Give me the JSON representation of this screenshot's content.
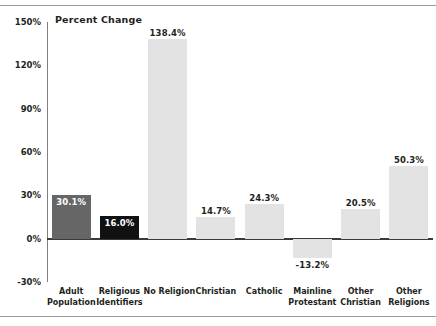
{
  "chart_data": {
    "type": "bar",
    "title": "Percent Change",
    "xlabel": "",
    "ylabel": "",
    "ylim": [
      -30,
      150
    ],
    "yticks": [
      "-30%",
      "0%",
      "30%",
      "60%",
      "90%",
      "120%",
      "150%"
    ],
    "ytick_values": [
      -30,
      0,
      30,
      60,
      90,
      120,
      150
    ],
    "grid": false,
    "legend": "none",
    "categories": [
      "Adult Population",
      "Religious Identifiers",
      "No Religion",
      "Christian",
      "Catholic",
      "Mainline Protestant",
      "Other Christian",
      "Other Religions"
    ],
    "category_lines": [
      [
        "Adult",
        "Population"
      ],
      [
        "Religious",
        "Identifiers"
      ],
      [
        "No Religion",
        ""
      ],
      [
        "Christian",
        ""
      ],
      [
        "Catholic",
        ""
      ],
      [
        "Mainline",
        "Protestant"
      ],
      [
        "Other",
        "Christian"
      ],
      [
        "Other",
        "Religions"
      ]
    ],
    "values": [
      30.1,
      16.0,
      138.4,
      14.7,
      24.3,
      -13.2,
      20.5,
      50.3
    ],
    "value_labels": [
      "30.1%",
      "16.0%",
      "138.4%",
      "14.7%",
      "24.3%",
      "-13.2%",
      "20.5%",
      "50.3%"
    ],
    "bar_colors": [
      "#666666",
      "#111111",
      "#e3e3e3",
      "#e3e3e3",
      "#e3e3e3",
      "#e3e3e3",
      "#e3e3e3",
      "#e3e3e3"
    ],
    "label_placement": [
      "inside",
      "inside",
      "above",
      "above",
      "above",
      "below",
      "above",
      "above"
    ]
  },
  "colors": {
    "background": "#ffffff",
    "axis": "#808080",
    "baseline": "#3a3a3a",
    "frame": "#9a9a9a",
    "text": "#231f20",
    "bar_light": "#e3e3e3",
    "bar_dark": "#666666",
    "bar_black": "#111111"
  }
}
